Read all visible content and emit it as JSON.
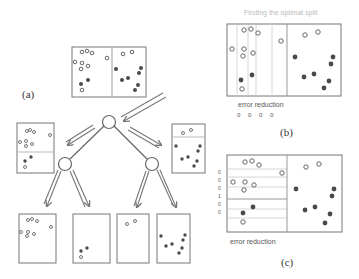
{
  "labels": {
    "a": "(a)",
    "b": "(b)",
    "c": "(c)"
  },
  "panel_b": {
    "title": "Finding the optimal split",
    "error_label": "error reduction",
    "error_values": "0 0 0  0"
  },
  "panel_c": {
    "error_label": "error reduction",
    "row_values": [
      "0",
      "0",
      "0",
      "1",
      "0",
      "0"
    ]
  },
  "colors": {
    "box": "#777777",
    "hollow": "#666666",
    "filled": "#4a4a4a",
    "arrow": "#777777",
    "splitline": "#bbbbbb"
  }
}
